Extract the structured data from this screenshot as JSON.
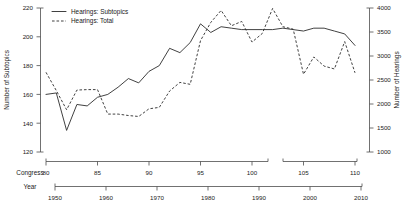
{
  "chart_data": {
    "type": "line",
    "title": "",
    "subtitle": "",
    "grid": false,
    "legend_position": "top-left",
    "xlabel_primary": "Congress",
    "xlabel_secondary": "Year",
    "ylabel_left": "Number of Subtopics",
    "ylabel_right": "Number of Hearings",
    "ylim_left": [
      120,
      220
    ],
    "ylim_right": [
      1000,
      4000
    ],
    "xlim_congress": [
      80,
      111
    ],
    "xlim_year": [
      1947,
      2011
    ],
    "yticks_left": [
      120,
      140,
      160,
      180,
      200,
      220
    ],
    "yticks_right": [
      1000,
      1500,
      2000,
      2500,
      3000,
      3500,
      4000
    ],
    "xticks_congress": [
      80,
      85,
      90,
      95,
      100,
      105,
      110
    ],
    "xticks_year": [
      1950,
      1960,
      1970,
      1980,
      1990,
      2000,
      2010
    ],
    "legend": [
      {
        "label": "Hearings: Subtopics",
        "style": "solid"
      },
      {
        "label": "Hearings: Total",
        "style": "dashed"
      }
    ],
    "x": [
      80,
      81,
      82,
      83,
      84,
      85,
      86,
      87,
      88,
      89,
      90,
      91,
      92,
      93,
      94,
      95,
      96,
      97,
      98,
      99,
      100,
      101,
      102,
      103,
      104,
      105,
      106,
      107,
      108,
      109,
      110
    ],
    "series": [
      {
        "name": "Hearings: Subtopics",
        "axis": "left",
        "style": "solid",
        "values": [
          160,
          161,
          135,
          153,
          152,
          158,
          160,
          165,
          171,
          168,
          176,
          180,
          192,
          189,
          196,
          209,
          203,
          207,
          206,
          205,
          205,
          205,
          205,
          206,
          205,
          204,
          206,
          206,
          204,
          202,
          194
        ]
      },
      {
        "name": "Hearings: Total",
        "axis": "right",
        "style": "dashed",
        "values": [
          2660,
          2280,
          1880,
          2290,
          2300,
          2300,
          1790,
          1790,
          1760,
          1740,
          1900,
          1930,
          2270,
          2450,
          2410,
          3320,
          3700,
          3950,
          3630,
          3720,
          3290,
          3470,
          3990,
          3610,
          3560,
          2620,
          2980,
          2790,
          2730,
          3300,
          2650
        ]
      }
    ]
  },
  "axis_labels": {
    "left_title": "Number of Subtopics",
    "right_title": "Number of Hearings",
    "congress_title": "Congress",
    "year_title": "Year"
  }
}
